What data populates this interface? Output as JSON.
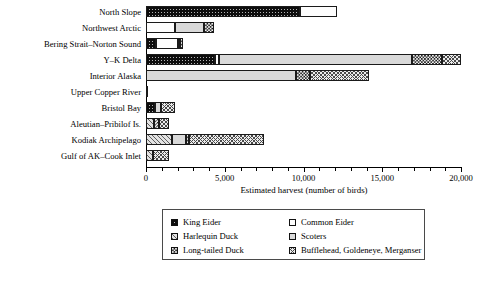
{
  "chart_data": {
    "type": "bar",
    "orientation": "horizontal",
    "stacked": true,
    "title": "",
    "xlabel": "Estimated harvest (number of birds)",
    "ylabel": "",
    "xlim": [
      0,
      20000
    ],
    "xticks": [
      0,
      5000,
      10000,
      15000,
      20000
    ],
    "xticklabels": [
      "0",
      "5,000",
      "10,000",
      "15,000",
      "20,000"
    ],
    "minor_tick_interval": 1000,
    "grid": false,
    "legend_position": "below-axis",
    "categories": [
      "North Slope",
      "Northwest Arctic",
      "Bering Strait–Norton Sound",
      "Y–K Delta",
      "Interior Alaska",
      "Upper Copper River",
      "Bristol Bay",
      "Aleutian–Pribilof Is.",
      "Kodiak Archipelago",
      "Gulf of AK–Cook Inlet"
    ],
    "series": [
      {
        "name": "King Eider",
        "pattern": "dark-speckled",
        "values": [
          9750,
          0,
          650,
          4400,
          0,
          0,
          550,
          0,
          0,
          0
        ]
      },
      {
        "name": "Common Eider",
        "pattern": "white-dotted",
        "values": [
          2350,
          1850,
          1400,
          250,
          0,
          0,
          0,
          0,
          0,
          0
        ]
      },
      {
        "name": "Harlequin Duck",
        "pattern": "diagonal-hatch",
        "values": [
          0,
          0,
          130,
          0,
          0,
          0,
          0,
          500,
          1650,
          450
        ]
      },
      {
        "name": "Scoters",
        "pattern": "solid-light-gray",
        "values": [
          0,
          1850,
          0,
          12250,
          9500,
          100,
          400,
          0,
          900,
          0
        ]
      },
      {
        "name": "Long-tailed Duck",
        "pattern": "checkerboard",
        "values": [
          0,
          600,
          180,
          1900,
          900,
          0,
          0,
          350,
          200,
          0
        ]
      },
      {
        "name": "Bufflehead, Goldeneye, Merganser",
        "pattern": "wavy-hatch",
        "values": [
          0,
          0,
          0,
          1200,
          3750,
          0,
          900,
          600,
          4750,
          1000
        ]
      }
    ],
    "totals": [
      12100,
      4300,
      2360,
      20000,
      14150,
      100,
      1850,
      1450,
      7500,
      1450
    ]
  },
  "legend": {
    "items": [
      {
        "label": "King Eider",
        "pattern": "p-king"
      },
      {
        "label": "Common Eider",
        "pattern": "p-common"
      },
      {
        "label": "Harlequin Duck",
        "pattern": "p-harlequin"
      },
      {
        "label": "Scoters",
        "pattern": "p-scoters"
      },
      {
        "label": "Long-tailed Duck",
        "pattern": "p-longtail"
      },
      {
        "label": "Bufflehead, Goldeneye, Merganser",
        "pattern": "p-buffle"
      }
    ]
  },
  "colors": {
    "axis": "#000000",
    "legend_border": "#4a4a4a",
    "background": "#ffffff"
  }
}
